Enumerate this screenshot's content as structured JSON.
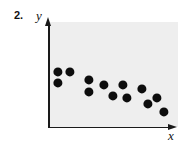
{
  "figure": {
    "exercise_number": "2.",
    "y_axis_label": "y",
    "x_axis_label": "x",
    "point_color": "#0d0d0d",
    "panel_color": "#eeeeee",
    "axis_color": "#1a1a1a"
  },
  "chart_data": {
    "type": "scatter",
    "title": "",
    "subtitle": "",
    "xlabel": "x",
    "ylabel": "y",
    "grid": false,
    "legend": null,
    "axis_arrows": true,
    "tick_labels": {
      "x": [],
      "y": []
    },
    "xlim": [
      0,
      100
    ],
    "ylim": [
      0,
      100
    ],
    "relationship": "negative",
    "annotations": [
      "2."
    ],
    "n_points": 13,
    "points": [
      {
        "px": 58,
        "py": 72,
        "x": 7,
        "y": 53
      },
      {
        "px": 70,
        "py": 72,
        "x": 17,
        "y": 53
      },
      {
        "px": 58,
        "py": 83,
        "x": 7,
        "y": 42
      },
      {
        "px": 89,
        "py": 80,
        "x": 32,
        "y": 45
      },
      {
        "px": 89,
        "py": 92,
        "x": 32,
        "y": 33
      },
      {
        "px": 104,
        "py": 85,
        "x": 43,
        "y": 40
      },
      {
        "px": 113,
        "py": 96,
        "x": 50,
        "y": 30
      },
      {
        "px": 123,
        "py": 85,
        "x": 58,
        "y": 40
      },
      {
        "px": 127,
        "py": 98,
        "x": 61,
        "y": 28
      },
      {
        "px": 142,
        "py": 89,
        "x": 73,
        "y": 36
      },
      {
        "px": 148,
        "py": 104,
        "x": 77,
        "y": 22
      },
      {
        "px": 157,
        "py": 98,
        "x": 84,
        "y": 28
      },
      {
        "px": 164,
        "py": 112,
        "x": 89,
        "y": 14
      }
    ],
    "point_radius_px": 4.6
  }
}
